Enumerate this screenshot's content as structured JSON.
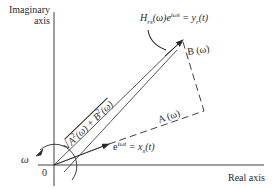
{
  "diagram": {
    "type": "phasor-diagram",
    "axes": {
      "vertical_label_line1": "Imaginary",
      "vertical_label_line2": "axis",
      "horizontal_label": "Real axis",
      "origin_label": "0"
    },
    "rotation_label": "ω",
    "vectors": {
      "input": {
        "label_base": "e",
        "label_exp": "iωt",
        "label_rest": " = x",
        "label_sub": "s",
        "label_tail": "(t)"
      },
      "output": {
        "label_h": "H",
        "label_h_sub": "rs",
        "label_h_mid": "(ω)e",
        "label_h_exp": "iωt",
        "label_eq": " = y",
        "label_y_sub": "r",
        "label_tail": "(t)"
      },
      "magnitude": {
        "sqrt": "√",
        "a": "A",
        "a_exp": "2",
        "a_arg": "(ω) + ",
        "b": "B",
        "b_exp": "2",
        "b_arg": "(ω)"
      }
    },
    "components": {
      "real_part": "A (ω)",
      "imag_part": "B (ω)"
    },
    "colors": {
      "ink": "#2a2a2a",
      "background": "#ffffff"
    }
  }
}
